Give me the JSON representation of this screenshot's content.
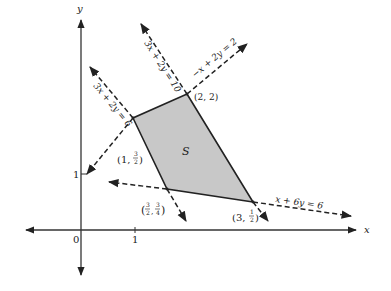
{
  "diagram": {
    "type": "feasible-region-plot",
    "axes": {
      "x_label": "x",
      "y_label": "y",
      "origin_label": "0",
      "x_tick_label": "1",
      "y_tick_label": "1"
    },
    "region": {
      "label": "S",
      "fill": "#c8c8c8",
      "vertices": [
        {
          "x": 2,
          "y": 2,
          "label": "(2, 2)"
        },
        {
          "x": 3,
          "y": 0.5,
          "label": "(3, 1/2)"
        },
        {
          "x": 1.5,
          "y": 0.75,
          "label": "(3/2, 3/4)"
        },
        {
          "x": 1,
          "y": 1.5,
          "label": "(1, 3/2)"
        }
      ]
    },
    "lines": [
      {
        "id": "l1",
        "equation": "3x + 2y = 10"
      },
      {
        "id": "l2",
        "equation": "3x + 2y = 6"
      },
      {
        "id": "l3",
        "equation": "−x + 2y = 2"
      },
      {
        "id": "l4",
        "equation": "x + 6y = 6"
      }
    ],
    "vertex_labels": {
      "v22": "(2, 2)",
      "v1_32_pre": "(1, ",
      "v1_32_num": "3",
      "v1_32_den": "2",
      "v32_34_num1": "3",
      "v32_34_den1": "2",
      "v32_34_num2": "3",
      "v32_34_den2": "4",
      "v3_12_pre": "(3, ",
      "v3_12_num": "1",
      "v3_12_den": "2"
    },
    "colors": {
      "ink": "#222222",
      "region_fill": "#c8c8c8"
    }
  }
}
